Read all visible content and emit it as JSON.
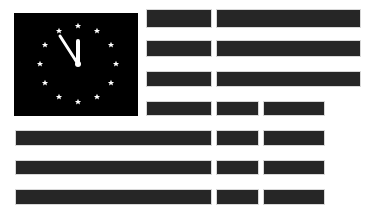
{
  "graphic": {
    "title": "",
    "description": "Flag-style graphic: black canton containing a clock face of 12 stars with hands near midnight, beside dark horizontal stripe bars",
    "colors": {
      "background": "#ffffff",
      "canton": "#000000",
      "stripe": "#262626",
      "star": "#ffffff"
    },
    "clock": {
      "stars": 12,
      "time": "11:55"
    },
    "stripe_rows": 7
  }
}
